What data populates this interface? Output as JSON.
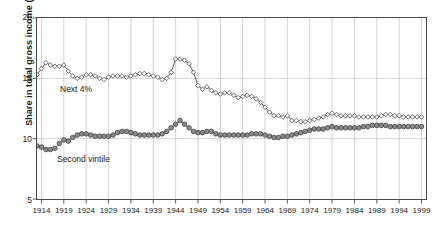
{
  "chart_data": {
    "type": "line",
    "title": "",
    "subtitle": "",
    "xlabel": "",
    "ylabel": "Share in total gross income (%)",
    "xlim": [
      1913,
      2000
    ],
    "ylim": [
      5,
      20
    ],
    "yticks": [
      5,
      10,
      15,
      20
    ],
    "xticks": [
      1914,
      1919,
      1924,
      1929,
      1934,
      1939,
      1944,
      1949,
      1954,
      1959,
      1964,
      1969,
      1974,
      1979,
      1984,
      1989,
      1994,
      1999
    ],
    "grid": "both",
    "legend_position": "inline-annotation",
    "annotations": [
      {
        "text": "Next 4%",
        "x": 1921,
        "y": 13.7
      },
      {
        "text": "Second vintile",
        "x": 1920,
        "y": 8.0
      }
    ],
    "series": [
      {
        "name": "Next 4%",
        "marker": "open-diamond",
        "color": "#4a4a4a",
        "points": [
          [
            1913,
            15.3
          ],
          [
            1914,
            15.8
          ],
          [
            1915,
            16.3
          ],
          [
            1916,
            16.1
          ],
          [
            1917,
            16.0
          ],
          [
            1918,
            16.0
          ],
          [
            1919,
            16.1
          ],
          [
            1920,
            15.6
          ],
          [
            1921,
            15.2
          ],
          [
            1922,
            15.0
          ],
          [
            1923,
            15.1
          ],
          [
            1924,
            15.3
          ],
          [
            1925,
            15.3
          ],
          [
            1926,
            15.2
          ],
          [
            1927,
            15.0
          ],
          [
            1928,
            14.9
          ],
          [
            1929,
            15.1
          ],
          [
            1930,
            15.2
          ],
          [
            1931,
            15.2
          ],
          [
            1932,
            15.2
          ],
          [
            1933,
            15.1
          ],
          [
            1934,
            15.2
          ],
          [
            1935,
            15.3
          ],
          [
            1936,
            15.4
          ],
          [
            1937,
            15.4
          ],
          [
            1938,
            15.3
          ],
          [
            1939,
            15.2
          ],
          [
            1940,
            15.1
          ],
          [
            1941,
            14.9
          ],
          [
            1942,
            15.0
          ],
          [
            1943,
            15.5
          ],
          [
            1944,
            16.6
          ],
          [
            1945,
            16.6
          ],
          [
            1946,
            16.5
          ],
          [
            1947,
            16.2
          ],
          [
            1948,
            15.5
          ],
          [
            1949,
            14.4
          ],
          [
            1950,
            14.1
          ],
          [
            1951,
            14.3
          ],
          [
            1952,
            14.0
          ],
          [
            1953,
            13.8
          ],
          [
            1954,
            13.7
          ],
          [
            1955,
            13.8
          ],
          [
            1956,
            13.8
          ],
          [
            1957,
            13.6
          ],
          [
            1958,
            13.4
          ],
          [
            1959,
            13.5
          ],
          [
            1960,
            13.6
          ],
          [
            1961,
            13.5
          ],
          [
            1962,
            13.3
          ],
          [
            1963,
            13.0
          ],
          [
            1964,
            12.6
          ],
          [
            1965,
            12.2
          ],
          [
            1966,
            11.9
          ],
          [
            1967,
            11.9
          ],
          [
            1968,
            11.8
          ],
          [
            1969,
            11.9
          ],
          [
            1970,
            11.5
          ],
          [
            1971,
            11.5
          ],
          [
            1972,
            11.4
          ],
          [
            1973,
            11.4
          ],
          [
            1974,
            11.5
          ],
          [
            1975,
            11.6
          ],
          [
            1976,
            11.7
          ],
          [
            1977,
            11.8
          ],
          [
            1978,
            12.0
          ],
          [
            1979,
            12.1
          ],
          [
            1980,
            12.0
          ],
          [
            1981,
            11.9
          ],
          [
            1982,
            11.9
          ],
          [
            1983,
            11.9
          ],
          [
            1984,
            11.9
          ],
          [
            1985,
            11.8
          ],
          [
            1986,
            11.8
          ],
          [
            1987,
            11.8
          ],
          [
            1988,
            11.8
          ],
          [
            1989,
            11.8
          ],
          [
            1990,
            11.9
          ],
          [
            1991,
            12.0
          ],
          [
            1992,
            12.0
          ],
          [
            1993,
            11.9
          ],
          [
            1994,
            11.9
          ],
          [
            1995,
            11.8
          ],
          [
            1996,
            11.8
          ],
          [
            1997,
            11.8
          ],
          [
            1998,
            11.8
          ],
          [
            1999,
            11.8
          ]
        ]
      },
      {
        "name": "Second vintile",
        "marker": "filled-circle",
        "color": "#6e6e6e",
        "points": [
          [
            1913,
            9.4
          ],
          [
            1914,
            9.3
          ],
          [
            1915,
            9.1
          ],
          [
            1916,
            9.1
          ],
          [
            1917,
            9.2
          ],
          [
            1918,
            9.6
          ],
          [
            1919,
            9.9
          ],
          [
            1920,
            9.8
          ],
          [
            1921,
            10.1
          ],
          [
            1922,
            10.3
          ],
          [
            1923,
            10.4
          ],
          [
            1924,
            10.4
          ],
          [
            1925,
            10.3
          ],
          [
            1926,
            10.2
          ],
          [
            1927,
            10.2
          ],
          [
            1928,
            10.2
          ],
          [
            1929,
            10.2
          ],
          [
            1930,
            10.3
          ],
          [
            1931,
            10.5
          ],
          [
            1932,
            10.6
          ],
          [
            1933,
            10.6
          ],
          [
            1934,
            10.5
          ],
          [
            1935,
            10.4
          ],
          [
            1936,
            10.3
          ],
          [
            1937,
            10.3
          ],
          [
            1938,
            10.3
          ],
          [
            1939,
            10.3
          ],
          [
            1940,
            10.3
          ],
          [
            1941,
            10.4
          ],
          [
            1942,
            10.6
          ],
          [
            1943,
            10.9
          ],
          [
            1944,
            11.2
          ],
          [
            1945,
            11.5
          ],
          [
            1946,
            11.2
          ],
          [
            1947,
            10.9
          ],
          [
            1948,
            10.6
          ],
          [
            1949,
            10.5
          ],
          [
            1950,
            10.5
          ],
          [
            1951,
            10.6
          ],
          [
            1952,
            10.6
          ],
          [
            1953,
            10.4
          ],
          [
            1954,
            10.3
          ],
          [
            1955,
            10.3
          ],
          [
            1956,
            10.3
          ],
          [
            1957,
            10.3
          ],
          [
            1958,
            10.3
          ],
          [
            1959,
            10.3
          ],
          [
            1960,
            10.3
          ],
          [
            1961,
            10.4
          ],
          [
            1962,
            10.4
          ],
          [
            1963,
            10.4
          ],
          [
            1964,
            10.3
          ],
          [
            1965,
            10.2
          ],
          [
            1966,
            10.1
          ],
          [
            1967,
            10.1
          ],
          [
            1968,
            10.2
          ],
          [
            1969,
            10.2
          ],
          [
            1970,
            10.3
          ],
          [
            1971,
            10.4
          ],
          [
            1972,
            10.5
          ],
          [
            1973,
            10.6
          ],
          [
            1974,
            10.7
          ],
          [
            1975,
            10.8
          ],
          [
            1976,
            10.8
          ],
          [
            1977,
            10.8
          ],
          [
            1978,
            10.9
          ],
          [
            1979,
            11.0
          ],
          [
            1980,
            10.9
          ],
          [
            1981,
            10.9
          ],
          [
            1982,
            10.9
          ],
          [
            1983,
            10.9
          ],
          [
            1984,
            10.9
          ],
          [
            1985,
            10.9
          ],
          [
            1986,
            11.0
          ],
          [
            1987,
            11.0
          ],
          [
            1988,
            11.1
          ],
          [
            1989,
            11.1
          ],
          [
            1990,
            11.1
          ],
          [
            1991,
            11.1
          ],
          [
            1992,
            11.0
          ],
          [
            1993,
            11.0
          ],
          [
            1994,
            11.0
          ],
          [
            1995,
            11.0
          ],
          [
            1996,
            11.0
          ],
          [
            1997,
            11.0
          ],
          [
            1998,
            11.0
          ],
          [
            1999,
            11.0
          ]
        ]
      }
    ]
  },
  "axis": {
    "y_tick_labels": [
      "20",
      "15",
      "10",
      "5"
    ],
    "x_tick_labels": [
      "1914",
      "1919",
      "1924",
      "1929",
      "1934",
      "1939",
      "1944",
      "1949",
      "1954",
      "1959",
      "1964",
      "1969",
      "1974",
      "1979",
      "1984",
      "1989",
      "1994",
      "1999"
    ],
    "y_axis_title": "Share in total gross income (%)"
  },
  "colors": {
    "frame": "#4a4a4a",
    "grid": "#c8c8c8",
    "series_next4": "#4a4a4a",
    "series_second": "#6e6e6e",
    "text": "#1a1a1a",
    "background": "#ffffff"
  }
}
